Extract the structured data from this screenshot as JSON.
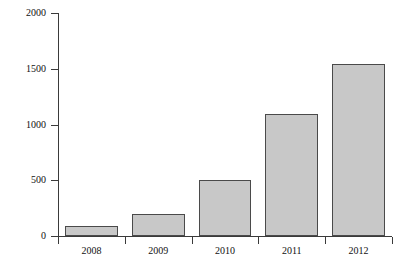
{
  "chart_data": {
    "type": "bar",
    "title": "",
    "subtitle": "",
    "xlabel": "",
    "ylabel": "$ Millions",
    "categories": [
      "2008",
      "2009",
      "2010",
      "2011",
      "2012"
    ],
    "values": [
      90,
      200,
      500,
      1090,
      1540
    ],
    "series": [
      {
        "name": "",
        "values": [
          90,
          200,
          500,
          1090,
          1540
        ]
      }
    ],
    "ylim": [
      0,
      2000
    ],
    "yticks": [
      0,
      500,
      1000,
      1500,
      2000
    ],
    "ytick_labels": [
      "0",
      "500",
      "1000",
      "1500",
      "2000"
    ],
    "grid": false,
    "legend": false,
    "legend_position": "none",
    "annotations": [],
    "colors": {
      "bar_fill": "#c8c8c8",
      "bar_border": "#4a4a4a",
      "axis": "#3a3a3a",
      "text": "#111111",
      "background": "#ffffff"
    }
  }
}
